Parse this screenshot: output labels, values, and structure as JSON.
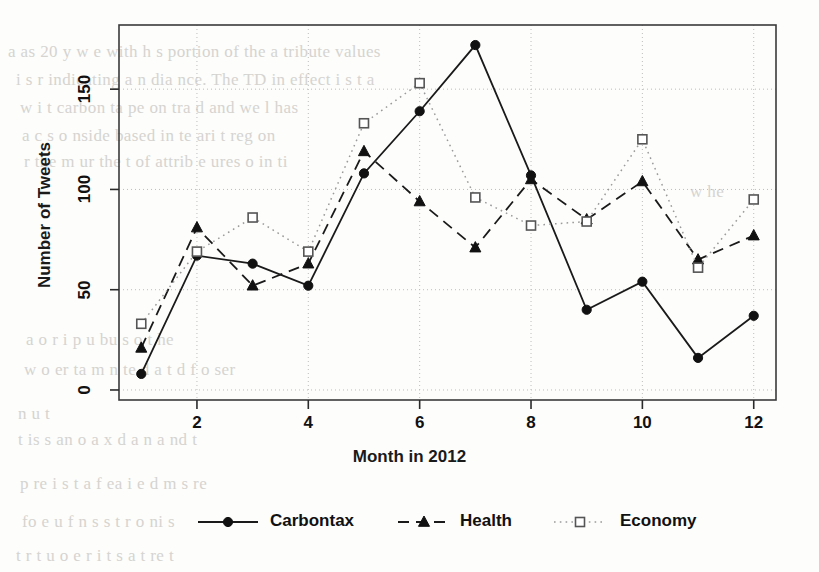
{
  "chart_data": {
    "type": "line",
    "title": "",
    "xlabel": "Month in 2012",
    "ylabel": "Number of Tweets",
    "x": [
      1,
      2,
      3,
      4,
      5,
      6,
      7,
      8,
      9,
      10,
      11,
      12
    ],
    "categories": [
      "1",
      "2",
      "3",
      "4",
      "5",
      "6",
      "7",
      "8",
      "9",
      "10",
      "11",
      "12"
    ],
    "xtick_labels": [
      "2",
      "4",
      "6",
      "8",
      "10",
      "12"
    ],
    "xticks": [
      2,
      4,
      6,
      8,
      10,
      12
    ],
    "ytick_labels": [
      "0",
      "50",
      "100",
      "150"
    ],
    "yticks": [
      0,
      50,
      100,
      150
    ],
    "xlim": [
      0.6,
      12.4
    ],
    "ylim": [
      -5,
      182
    ],
    "grid": true,
    "grid_style": "dotted",
    "legend_position": "bottom-center",
    "series": [
      {
        "name": "Carbontax",
        "marker": "filled-circle",
        "linestyle": "solid",
        "color": "#1a1a1a",
        "values": [
          8,
          67,
          63,
          52,
          108,
          139,
          172,
          107,
          40,
          54,
          16,
          37
        ]
      },
      {
        "name": "Health",
        "marker": "filled-triangle",
        "linestyle": "dashed",
        "color": "#1a1a1a",
        "values": [
          21,
          81,
          52,
          63,
          119,
          94,
          71,
          105,
          85,
          104,
          65,
          77
        ]
      },
      {
        "name": "Economy",
        "marker": "open-square",
        "linestyle": "dotted",
        "color": "#8a8a8a",
        "values": [
          33,
          69,
          86,
          69,
          133,
          153,
          96,
          82,
          84,
          125,
          61,
          95
        ]
      }
    ]
  },
  "legend": {
    "entries": [
      {
        "label": "Carbontax"
      },
      {
        "label": "Health"
      },
      {
        "label": "Economy"
      }
    ]
  },
  "background_text": {
    "lines": [
      {
        "text": "a   as   20   y    w  e  with   h  s  portion  of  the  a  tribute  values",
        "x": 8,
        "y": 42
      },
      {
        "text": "i  s   r  indicating  a  n  dia    nce.   The    TD     in  effect  i  s  t    a",
        "x": 16,
        "y": 70
      },
      {
        "text": "w     i   t    carbon  ta     pe  on  tra   d  and  we  l  has",
        "x": 20,
        "y": 98
      },
      {
        "text": "a       c   s  o      nside    based  in  te    ari  t    reg  on",
        "x": 22,
        "y": 126
      },
      {
        "text": "r  the  m   ur  the  t     of  attrib   e     ures   o    in    ti",
        "x": 24,
        "y": 152
      },
      {
        "text": "w  he",
        "x": 690,
        "y": 182
      },
      {
        "text": "a  o    r   i  p        u   bu       s   o   t   he",
        "x": 26,
        "y": 330
      },
      {
        "text": "w  o    er  ta   m    n   te    d   a   t    d   f  o    ser",
        "x": 24,
        "y": 360
      },
      {
        "text": "n   u  t",
        "x": 18,
        "y": 404
      },
      {
        "text": "t  is  s     an      o         a   x     d  a    n   a  nd  t",
        "x": 18,
        "y": 430
      },
      {
        "text": "p  re    i  s  t    a   f   ea   i  e     d    m   s   re",
        "x": 20,
        "y": 474
      },
      {
        "text": "fo   e    u   f      n      s  s     t    r    o    ni  s",
        "x": 22,
        "y": 512
      },
      {
        "text": "t    r  t    u      o   e   r   i  t   s  a  t   re   t",
        "x": 16,
        "y": 546
      }
    ]
  }
}
